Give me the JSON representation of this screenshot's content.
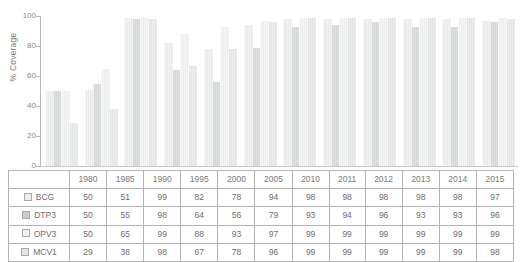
{
  "chart_data": {
    "type": "bar",
    "title": "",
    "xlabel": "",
    "ylabel": "% Coverage",
    "ylim": [
      0,
      100
    ],
    "yticks": [
      0,
      20,
      40,
      60,
      80,
      100
    ],
    "grid": false,
    "legend_position": "table-row-headers",
    "categories": [
      "1980",
      "1985",
      "1990",
      "1995",
      "2000",
      "2005",
      "2010",
      "2011",
      "2012",
      "2013",
      "2014",
      "2015"
    ],
    "series": [
      {
        "name": "BCG",
        "color": "#eeefef",
        "values": [
          50,
          51,
          99,
          82,
          78,
          94,
          98,
          98,
          98,
          98,
          98,
          97
        ]
      },
      {
        "name": "DTP3",
        "color": "#c9caca",
        "values": [
          50,
          55,
          98,
          64,
          56,
          79,
          93,
          94,
          96,
          93,
          93,
          96
        ]
      },
      {
        "name": "OPV3",
        "color": "#f0f1f1",
        "values": [
          50,
          65,
          99,
          88,
          93,
          97,
          99,
          99,
          99,
          99,
          99,
          99
        ]
      },
      {
        "name": "MCV1",
        "color": "#e3e4e4",
        "values": [
          29,
          38,
          98,
          67,
          78,
          96,
          99,
          99,
          99,
          99,
          99,
          98
        ]
      }
    ]
  },
  "axis": {
    "ylabel": "% Coverage",
    "ticks": [
      "100",
      "80",
      "60",
      "40",
      "20",
      "0"
    ]
  },
  "table": {
    "corner_label": "",
    "column_headers": [
      "1980",
      "1985",
      "1990",
      "1995",
      "2000",
      "2005",
      "2010",
      "2011",
      "2012",
      "2013",
      "2014",
      "2015"
    ],
    "rows": [
      {
        "label": "BCG",
        "swatch": "bcg-swatch",
        "values": [
          "50",
          "51",
          "99",
          "82",
          "78",
          "94",
          "98",
          "98",
          "98",
          "98",
          "98",
          "97"
        ]
      },
      {
        "label": "DTP3",
        "swatch": "dtp3-swatch",
        "values": [
          "50",
          "55",
          "98",
          "64",
          "56",
          "79",
          "93",
          "94",
          "96",
          "93",
          "93",
          "96"
        ]
      },
      {
        "label": "OPV3",
        "swatch": "opv3-swatch",
        "values": [
          "50",
          "65",
          "99",
          "88",
          "93",
          "97",
          "99",
          "99",
          "99",
          "99",
          "99",
          "99"
        ]
      },
      {
        "label": "MCV1",
        "swatch": "mcv1-swatch",
        "values": [
          "29",
          "38",
          "98",
          "67",
          "78",
          "96",
          "99",
          "99",
          "99",
          "99",
          "99",
          "98"
        ]
      }
    ]
  },
  "colors": {
    "series_bcg": "#eeefef",
    "series_dtp3": "#c9caca",
    "series_opv3": "#f0f1f1",
    "series_mcv1": "#e3e4e4",
    "axis": "#b9b9b9",
    "text": "#6e6e6e",
    "table_border": "#b4b4b4",
    "background": "#ffffff"
  }
}
